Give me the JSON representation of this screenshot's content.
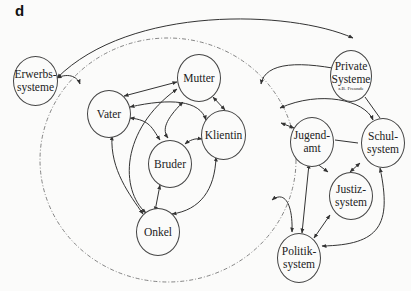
{
  "panel_label": "d",
  "nodes": {
    "erwerbs": {
      "line1": "Erwerbs-",
      "line2": "systeme"
    },
    "mutter": {
      "label": "Mutter"
    },
    "vater": {
      "label": "Vater"
    },
    "klientin": {
      "label": "Klientin"
    },
    "bruder": {
      "label": "Bruder"
    },
    "onkel": {
      "label": "Onkel"
    },
    "private": {
      "line1": "Private",
      "line2": "Systeme",
      "note": "z.B. Freunde"
    },
    "jugendamt": {
      "line1": "Jugend-",
      "line2": "amt"
    },
    "schul": {
      "line1": "Schul-",
      "line2": "system"
    },
    "justiz": {
      "line1": "Justiz-",
      "line2": "system"
    },
    "politik": {
      "line1": "Politik-",
      "line2": "system"
    }
  },
  "colors": {
    "line": "#333333",
    "dashed": "#666666",
    "background": "#fbfbfa"
  }
}
